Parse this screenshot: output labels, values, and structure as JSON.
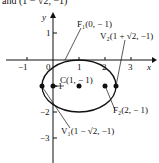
{
  "caption_fragment": "and (1 − √2, −1)",
  "figure": {
    "axes": {
      "x_label": "x",
      "y_label": "y",
      "x_ticks": [
        "−1",
        "0",
        "1",
        "2",
        "3"
      ],
      "y_ticks": [
        "1",
        "−1",
        "−2",
        "−3"
      ]
    },
    "ellipse": {
      "center": [
        1,
        -1
      ],
      "a": "√2",
      "b": 1
    },
    "points": [
      {
        "name": "C",
        "label": "C(1, − 1)"
      },
      {
        "name": "F1",
        "label": "F₁(0, − 1)"
      },
      {
        "name": "F2",
        "label": "F₂(2, − 1)"
      },
      {
        "name": "V1",
        "label": "V₁(1 − √2, −1)"
      },
      {
        "name": "V2",
        "label": "V₂(1 + √2, −1)"
      }
    ]
  }
}
